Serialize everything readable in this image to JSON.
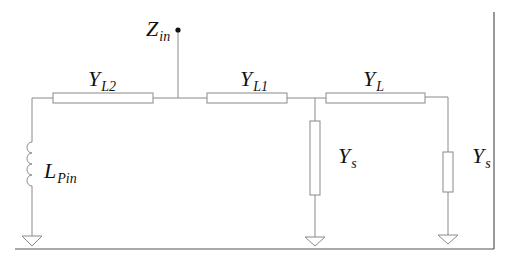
{
  "diagram": {
    "type": "circuit-schematic",
    "labels": {
      "zin": {
        "main": "Z",
        "sub": "in"
      },
      "yl2": {
        "main": "Y",
        "sub": "L2"
      },
      "yl1": {
        "main": "Y",
        "sub": "L1"
      },
      "yl": {
        "main": "Y",
        "sub": "L"
      },
      "lpin": {
        "main": "L",
        "sub": "Pin"
      },
      "ys_mid": {
        "main": "Y",
        "sub": "s"
      },
      "ys_right": {
        "main": "Y",
        "sub": "s"
      }
    },
    "components": [
      {
        "id": "LPin",
        "kind": "inductor",
        "connection": "shunt to ground at left end"
      },
      {
        "id": "YL2",
        "kind": "transmission-line",
        "connection": "series"
      },
      {
        "id": "Zin",
        "kind": "port",
        "connection": "input terminal between YL2 and YL1"
      },
      {
        "id": "YL1",
        "kind": "transmission-line",
        "connection": "series"
      },
      {
        "id": "Ys_mid",
        "kind": "stub",
        "connection": "shunt to ground between YL1 and YL"
      },
      {
        "id": "YL",
        "kind": "transmission-line",
        "connection": "series"
      },
      {
        "id": "Ys_right",
        "kind": "stub",
        "connection": "shunt to ground at right end"
      }
    ],
    "colors": {
      "wire": "#8a8a8a",
      "frame": "#555555",
      "text": "#111111",
      "background": "#ffffff"
    }
  }
}
